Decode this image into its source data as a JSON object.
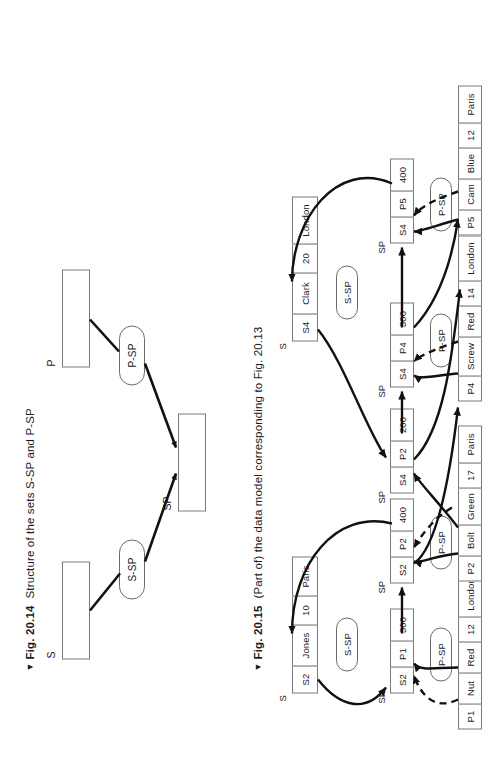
{
  "figures": [
    {
      "marker": "▼",
      "label": "Fig. 20.14",
      "caption": "Structure of the sets S-SP and P-SP",
      "record_types": [
        {
          "name": "S"
        },
        {
          "name": "P"
        },
        {
          "name": "SP"
        }
      ],
      "sets": [
        {
          "name": "S-SP",
          "owner": "S",
          "member": "SP"
        },
        {
          "name": "P-SP",
          "owner": "P",
          "member": "SP"
        }
      ]
    },
    {
      "marker": "▼",
      "label": "Fig. 20.15",
      "caption": "(Part of) the data model corresponding to Fig. 20.13",
      "owner_label_s": "S",
      "pointer_label": "SP",
      "set_label_s_sp": "S-SP",
      "set_label_p_sp": "P-SP",
      "supplier_records": [
        {
          "id": "S4",
          "fields": [
            "S4",
            "Clark",
            "20",
            "London"
          ]
        },
        {
          "id": "S2",
          "fields": [
            "S2",
            "Jones",
            "10",
            "Paris"
          ]
        }
      ],
      "part_records": [
        {
          "id": "P5",
          "fields": [
            "P5",
            "Cam",
            "Blue",
            "12",
            "Paris"
          ]
        },
        {
          "id": "P4",
          "fields": [
            "P4",
            "Screw",
            "Red",
            "14",
            "London"
          ]
        },
        {
          "id": "P2",
          "fields": [
            "P2",
            "Bolt",
            "Green",
            "17",
            "Paris"
          ]
        },
        {
          "id": "P1",
          "fields": [
            "P1",
            "Nut",
            "Red",
            "12",
            "London"
          ]
        }
      ],
      "shipment_records": [
        {
          "id": "S4-P5",
          "fields": [
            "S4",
            "P5",
            "400"
          ]
        },
        {
          "id": "S4-P4",
          "fields": [
            "S4",
            "P4",
            "300"
          ]
        },
        {
          "id": "S4-P2",
          "fields": [
            "S4",
            "P2",
            "200"
          ]
        },
        {
          "id": "S2-P2",
          "fields": [
            "S2",
            "P2",
            "400"
          ]
        },
        {
          "id": "S2-P1",
          "fields": [
            "S2",
            "P1",
            "300"
          ]
        }
      ],
      "set_occurrence_labels": {
        "s_sp_upper": "S-SP",
        "s_sp_lower": "S-SP",
        "p_sp_1": "P-SP",
        "p_sp_2": "P-SP",
        "p_sp_3": "P-SP",
        "p_sp_4": "P-SP"
      }
    }
  ],
  "colors": {
    "line": "#111111",
    "box_border": "#6a6a6a",
    "text": "#1a1a1a",
    "background": "#ffffff"
  }
}
